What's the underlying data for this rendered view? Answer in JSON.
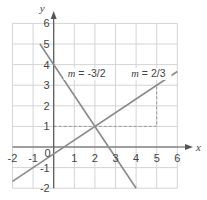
{
  "chart_data": {
    "type": "line",
    "title": "",
    "xlabel": "x",
    "ylabel": "y",
    "xlim": [
      -2,
      6
    ],
    "ylim": [
      -2,
      6
    ],
    "grid": true,
    "x_ticks": [
      "-2",
      "-1",
      "0",
      "1",
      "2",
      "3",
      "4",
      "5",
      "6"
    ],
    "y_ticks": [
      "-2",
      "-1",
      "1",
      "2",
      "3",
      "4",
      "5",
      "6"
    ],
    "origin_label": "0",
    "series": [
      {
        "name": "m = -3/2",
        "slope": -1.5,
        "intercept": 4,
        "x": [
          -0.667,
          4
        ],
        "y": [
          5,
          -2
        ]
      },
      {
        "name": "m = 2/3",
        "slope": 0.6667,
        "intercept": -0.333,
        "x": [
          -2,
          6
        ],
        "y": [
          -1.667,
          3.667
        ]
      }
    ],
    "annotations": [
      {
        "text": "m = -3/2",
        "x": 1.6,
        "y": 3.4
      },
      {
        "text": "m = 2/3",
        "x": 4.6,
        "y": 3.4
      },
      {
        "type": "dashed-guide",
        "points": [
          [
            0,
            1
          ],
          [
            5,
            1
          ],
          [
            5,
            3
          ]
        ]
      }
    ],
    "intersection": [
      2,
      1
    ]
  },
  "labels": {
    "x_axis": "x",
    "y_axis": "y",
    "line1_label_m": "m",
    "line1_label_rest": " = -3/2",
    "line2_label_m": "m",
    "line2_label_rest": " = 2/3"
  },
  "colors": {
    "grid": "#d4d4d4",
    "axis": "#555555",
    "line": "#8a8a8a",
    "dash": "#999999",
    "text": "#444444"
  }
}
